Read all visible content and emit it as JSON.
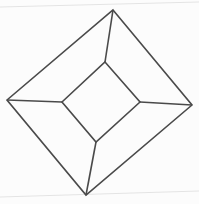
{
  "diagram": {
    "title": "",
    "stroke_color": "#4a4a4a",
    "outer_square": [
      [
        113,
        10
      ],
      [
        192,
        105
      ],
      [
        86,
        195
      ],
      [
        7,
        100
      ]
    ],
    "inner_square": [
      [
        105,
        62
      ],
      [
        140,
        102
      ],
      [
        96,
        142
      ],
      [
        62,
        102
      ]
    ],
    "connectors": [
      [
        [
          113,
          10
        ],
        [
          105,
          62
        ]
      ],
      [
        [
          192,
          105
        ],
        [
          140,
          102
        ]
      ],
      [
        [
          86,
          195
        ],
        [
          96,
          142
        ]
      ],
      [
        [
          7,
          100
        ],
        [
          62,
          102
        ]
      ]
    ],
    "page_edges": [
      [
        [
          0,
          7
        ],
        [
          199,
          2
        ]
      ],
      [
        [
          0,
          197
        ],
        [
          199,
          191
        ]
      ]
    ]
  }
}
